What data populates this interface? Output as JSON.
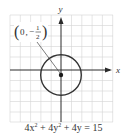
{
  "figure": {
    "axes": {
      "x_label": "x",
      "y_label": "y"
    },
    "point_label": {
      "coord_x": "0",
      "separator": ",",
      "sign": "−",
      "numerator": "1",
      "denominator": "2",
      "open_paren": "(",
      "close_paren": ")"
    },
    "equation": {
      "part1": "4x",
      "exp1": "2",
      "part2": " + 4y",
      "exp2": "2",
      "part3": " + 4y = 15"
    },
    "colors": {
      "grid": "#d4d4d4",
      "axis": "#2a2a2a",
      "curve": "#333333"
    },
    "circle": {
      "center": [
        0,
        -0.5
      ],
      "radius": 2
    }
  }
}
